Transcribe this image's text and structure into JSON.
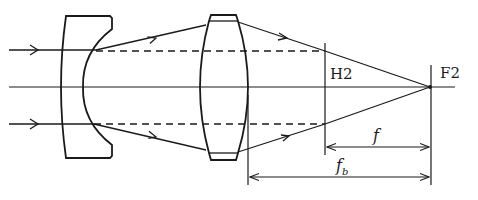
{
  "diagram": {
    "type": "optical-ray-diagram",
    "colors": {
      "stroke": "#1a1a1a",
      "background": "#ffffff"
    },
    "elements": [
      {
        "id": "negative-lens",
        "kind": "lens",
        "power": "negative"
      },
      {
        "id": "positive-lens",
        "kind": "lens",
        "power": "positive"
      },
      {
        "id": "principal-plane-h2",
        "kind": "plane"
      },
      {
        "id": "focal-point-f2",
        "kind": "point"
      }
    ],
    "labels": {
      "principal_plane": "H2",
      "focal_point": "F2",
      "focal_length": "f",
      "back_focal_length_main": "f",
      "back_focal_length_sub": "b"
    },
    "dimensions": [
      {
        "name": "f",
        "from": "H2",
        "to": "F2"
      },
      {
        "name": "f_b",
        "from": "positive lens rear vertex",
        "to": "F2"
      }
    ]
  }
}
